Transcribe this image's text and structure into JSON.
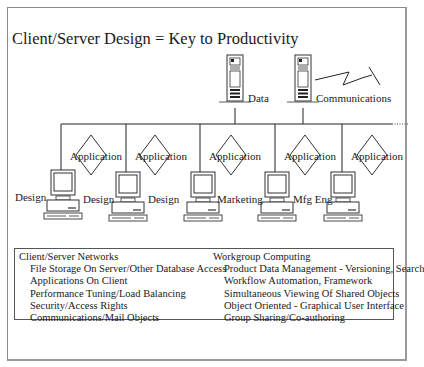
{
  "title": "Client/Server Design = Key to Productivity",
  "servers": [
    {
      "label": "Data"
    },
    {
      "label": "Communications"
    }
  ],
  "application_label": "Application",
  "applications": [
    "Application",
    "Application",
    "Application",
    "Application",
    "Application"
  ],
  "clients": [
    {
      "label": "Design"
    },
    {
      "label": "Design"
    },
    {
      "label": "Design"
    },
    {
      "label": "Marketing"
    },
    {
      "label": "Mfg Eng"
    }
  ],
  "info_box": {
    "left": {
      "heading": "Client/Server Networks",
      "items": [
        "File Storage On Server/Other Database Access",
        "Applications On Client",
        "Performance Tuning/Load Balancing",
        "Security/Access Rights",
        "Communications/Mail Objects"
      ]
    },
    "right": {
      "heading": "Workgroup Computing",
      "items": [
        "Product Data Management - Versioning, Search",
        "Workflow Automation, Framework",
        "Simultaneous Viewing Of Shared Objects",
        "Object Oriented - Graphical User Interface",
        "Group Sharing/Co-authoring"
      ]
    }
  },
  "colors": {
    "line": "#1a1a1a",
    "frame": "#8a8a8a",
    "background": "#ffffff"
  }
}
